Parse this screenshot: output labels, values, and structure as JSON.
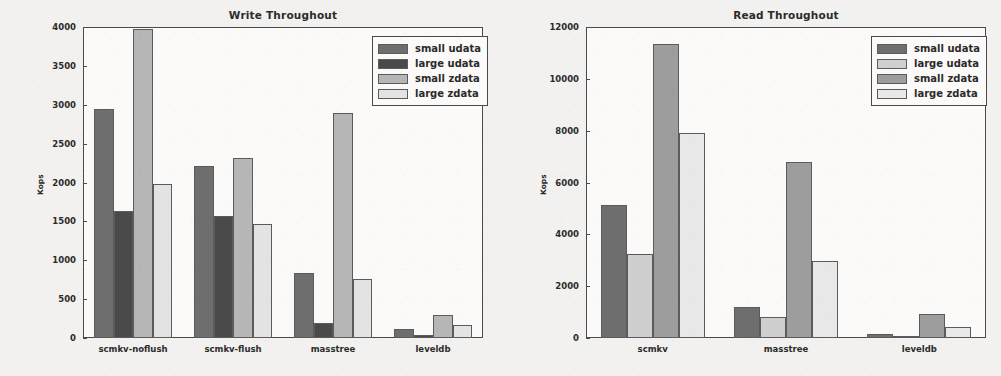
{
  "figure": {
    "background_color": "#f2f1ef",
    "axis_color": "#4a4a4a"
  },
  "chart_data": [
    {
      "type": "bar",
      "title": "Write Throughout",
      "xlabel": "",
      "ylabel": "Kops",
      "categories": [
        "scmkv-noflush",
        "scmkv-flush",
        "masstree",
        "leveldb"
      ],
      "series": [
        {
          "name": "small udata",
          "color": "#6e6e6e",
          "values": [
            2950,
            2210,
            840,
            110
          ]
        },
        {
          "name": "large udata",
          "color": "#4a4a4a",
          "values": [
            1630,
            1565,
            190,
            40
          ]
        },
        {
          "name": "small zdata",
          "color": "#b6b6b6",
          "values": [
            3980,
            2310,
            2890,
            300
          ]
        },
        {
          "name": "large zdata",
          "color": "#e3e3e3",
          "values": [
            1985,
            1465,
            765,
            170
          ]
        }
      ],
      "ylim": [
        0,
        4000
      ],
      "yticks": [
        0,
        500,
        1000,
        1500,
        2000,
        2500,
        3000,
        3500,
        4000
      ],
      "grid": false,
      "legend_position": "upper right",
      "legend_entries": [
        "small udata",
        "large udata",
        "small zdata",
        "large zdata"
      ]
    },
    {
      "type": "bar",
      "title": "Read Throughout",
      "xlabel": "",
      "ylabel": "Kops",
      "categories": [
        "scmkv",
        "masstree",
        "leveldb"
      ],
      "series": [
        {
          "name": "small udata",
          "color": "#6e6e6e",
          "values": [
            5150,
            1210,
            140
          ]
        },
        {
          "name": "large udata",
          "color": "#cfcfcf",
          "values": [
            3230,
            820,
            60
          ]
        },
        {
          "name": "small zdata",
          "color": "#9d9d9d",
          "values": [
            11350,
            6780,
            920
          ]
        },
        {
          "name": "large zdata",
          "color": "#e8e8e8",
          "values": [
            7900,
            2970,
            440
          ]
        }
      ],
      "ylim": [
        0,
        12000
      ],
      "yticks": [
        0,
        2000,
        4000,
        6000,
        8000,
        10000,
        12000
      ],
      "grid": false,
      "legend_position": "upper right",
      "legend_entries": [
        "small udata",
        "large udata",
        "small zdata",
        "large zdata"
      ]
    }
  ]
}
